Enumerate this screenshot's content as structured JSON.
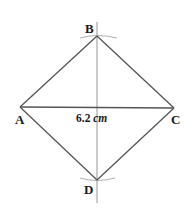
{
  "diagram": {
    "shape": "rhombus/square ABCD constructed with perpendicular bisector",
    "vertices": {
      "A": {
        "label": "A",
        "x": 20,
        "y": 107
      },
      "B": {
        "label": "B",
        "x": 97,
        "y": 36
      },
      "C": {
        "label": "C",
        "x": 174,
        "y": 108
      },
      "D": {
        "label": "D",
        "x": 97,
        "y": 180
      }
    },
    "diagonal_AC": {
      "value": "6.2",
      "unit": "cm"
    },
    "colors": {
      "line": "#555555",
      "construction": "#8a8a8a",
      "text": "#1a1a1a"
    }
  }
}
